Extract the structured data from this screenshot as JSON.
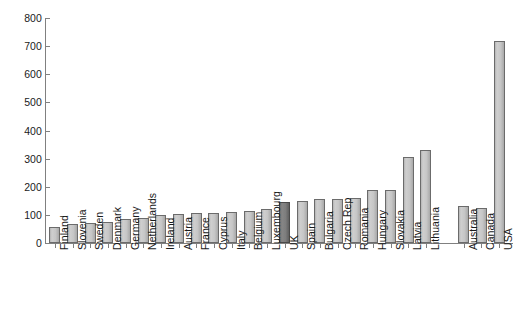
{
  "chart_data": {
    "type": "bar",
    "title": "",
    "subtitle": "",
    "xlabel": "",
    "ylabel": "",
    "ylim": [
      0,
      800
    ],
    "ytick_step": 100,
    "yticks": [
      0,
      100,
      200,
      300,
      400,
      500,
      600,
      700,
      800
    ],
    "ytick_labels": [
      "0",
      "100",
      "200",
      "300",
      "400",
      "500",
      "600",
      "700",
      "800"
    ],
    "grid": false,
    "legend": null,
    "legend_position": "none",
    "highlighted_category": "UK",
    "group_gap_after": "Lithuania",
    "categories": [
      "Finland",
      "Slovenia",
      "Sweden",
      "Denmark",
      "Germany",
      "Netherlands",
      "Ireland",
      "Austria",
      "France",
      "Cyprus",
      "Italy",
      "Belgium",
      "Luxembourg",
      "UK",
      "Spain",
      "Bulgaria",
      "Czech Rep",
      "Romania",
      "Hungary",
      "Slovakia",
      "Latvia",
      "Lithuania",
      "Australia",
      "Canada",
      "USA"
    ],
    "values": [
      57,
      67,
      70,
      75,
      85,
      88,
      98,
      103,
      105,
      108,
      110,
      113,
      122,
      145,
      150,
      157,
      158,
      160,
      190,
      190,
      307,
      332,
      133,
      123,
      718
    ],
    "bar_colors": {
      "default": "#c6c6c6",
      "highlight": "#7d7d7d",
      "outline": "#6b6b6b"
    },
    "axis_color": "#808080",
    "text_color": "#1a1a1a"
  }
}
